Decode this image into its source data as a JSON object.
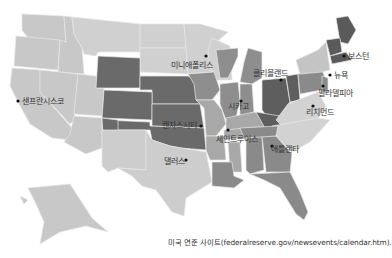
{
  "map": {
    "title": "Federal Reserve Districts",
    "colors": {
      "light": "#c8c8c8",
      "lighter": "#d2d2d2",
      "mid": "#a0a0a0",
      "midlight": "#b4b4b4",
      "dark": "#6e6e6e",
      "darker": "#5e5e5e",
      "background": "#ffffff",
      "dot": "#111111"
    },
    "cities": [
      {
        "name": "샌프란시스코",
        "x": 18,
        "y": 101,
        "label_x": 22,
        "label_y": 104
      },
      {
        "name": "미니애폴리스",
        "x": 206,
        "y": 56,
        "label_x": 171,
        "label_y": 68
      },
      {
        "name": "캔자스시티",
        "x": 201,
        "y": 126,
        "label_x": 162,
        "label_y": 128
      },
      {
        "name": "세인트루이스",
        "x": 228,
        "y": 130,
        "label_x": 216,
        "label_y": 142
      },
      {
        "name": "시카고",
        "x": 241,
        "y": 101,
        "label_x": 228,
        "label_y": 109
      },
      {
        "name": "클리블랜드",
        "x": 281,
        "y": 80,
        "label_x": 253,
        "label_y": 76
      },
      {
        "name": "보스턴",
        "x": 344,
        "y": 56,
        "label_x": 348,
        "label_y": 59
      },
      {
        "name": "뉴욕",
        "x": 330,
        "y": 75,
        "label_x": 334,
        "label_y": 78
      },
      {
        "name": "필라델피아",
        "x": 323,
        "y": 86,
        "label_x": 318,
        "label_y": 96
      },
      {
        "name": "리치먼드",
        "x": 313,
        "y": 106,
        "label_x": 306,
        "label_y": 115
      },
      {
        "name": "애틀랜타",
        "x": 272,
        "y": 146,
        "label_x": 271,
        "label_y": 152
      },
      {
        "name": "댈러스",
        "x": 186,
        "y": 160,
        "label_x": 164,
        "label_y": 164
      }
    ]
  },
  "caption": "미국 연준 사이트(federalreserve.gov/newsevents/calendar.htm)."
}
